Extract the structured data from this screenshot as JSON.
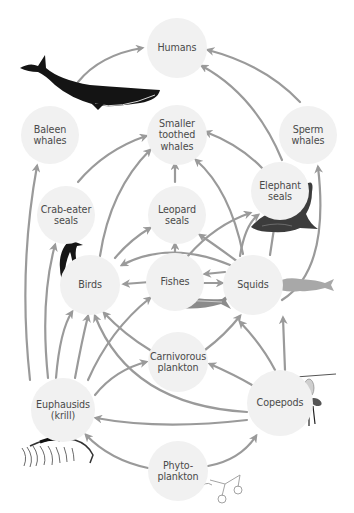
{
  "diagram": {
    "type": "food-web",
    "arrow_color": "#9a9a9a",
    "node_fill": "#f1f1f1",
    "label_color": "#4a4a4a",
    "nodes": [
      {
        "id": "humans",
        "label": "Humans",
        "x": 177,
        "y": 48,
        "r": 30
      },
      {
        "id": "baleen",
        "label": "Baleen\nwhales",
        "x": 50,
        "y": 135,
        "r": 29
      },
      {
        "id": "toothed",
        "label": "Smaller\ntoothed\nwhales",
        "x": 177,
        "y": 135,
        "r": 30
      },
      {
        "id": "sperm",
        "label": "Sperm\nwhales",
        "x": 308,
        "y": 135,
        "r": 29
      },
      {
        "id": "crabeater",
        "label": "Crab-eater\nseals",
        "x": 66,
        "y": 215,
        "r": 29
      },
      {
        "id": "leopard",
        "label": "Leopard\nseals",
        "x": 177,
        "y": 215,
        "r": 29
      },
      {
        "id": "elephant",
        "label": "Elephant\nseals",
        "x": 280,
        "y": 191,
        "r": 29
      },
      {
        "id": "birds",
        "label": "Birds",
        "x": 90,
        "y": 285,
        "r": 30
      },
      {
        "id": "fishes",
        "label": "Fishes",
        "x": 175,
        "y": 282,
        "r": 29
      },
      {
        "id": "squids",
        "label": "Squids",
        "x": 253,
        "y": 285,
        "r": 30
      },
      {
        "id": "carniv",
        "label": "Carnivorous\nplankton",
        "x": 178,
        "y": 362,
        "r": 30
      },
      {
        "id": "krill",
        "label": "Euphausids\n(krill)",
        "x": 63,
        "y": 410,
        "r": 32
      },
      {
        "id": "copepods",
        "label": "Copepods",
        "x": 280,
        "y": 403,
        "r": 33
      },
      {
        "id": "phyto",
        "label": "Phyto-\nplankton",
        "x": 178,
        "y": 471,
        "r": 30
      }
    ],
    "edges": [
      {
        "from": "baleen",
        "to": "humans",
        "d": "M78,82 Q100,55 142,48"
      },
      {
        "from": "sperm",
        "to": "humans",
        "d": "M300,102 Q265,65 208,50"
      },
      {
        "from": "elephant",
        "to": "humans",
        "d": "M282,160 Q255,95 202,66"
      },
      {
        "from": "crabeater",
        "to": "toothed",
        "d": "M78,182 Q105,150 146,136"
      },
      {
        "from": "leopard",
        "to": "toothed",
        "d": "M175,182 L175,164"
      },
      {
        "from": "elephant",
        "to": "toothed",
        "d": "M262,168 Q240,145 206,132"
      },
      {
        "from": "birds",
        "to": "toothed",
        "d": "M100,256 Q110,190 150,150"
      },
      {
        "from": "squids",
        "to": "toothed",
        "d": "M243,254 Q230,190 196,160"
      },
      {
        "from": "krill",
        "to": "baleen",
        "d": "M30,380 Q18,270 37,166"
      },
      {
        "from": "squids",
        "to": "sperm",
        "d": "M282,300 Q330,270 318,167"
      },
      {
        "from": "krill",
        "to": "crabeater",
        "d": "M48,378 Q40,300 55,245"
      },
      {
        "from": "birds",
        "to": "leopard",
        "d": "M115,258 Q130,240 150,228"
      },
      {
        "from": "fishes",
        "to": "leopard",
        "d": "M175,252 L175,244"
      },
      {
        "from": "squids",
        "to": "elephant",
        "d": "M240,256 Q245,225 258,215"
      },
      {
        "from": "fishes",
        "to": "elephant",
        "d": "M188,256 Q215,225 250,213"
      },
      {
        "from": "squids",
        "to": "leopard",
        "d": "M238,262 Q215,245 200,235"
      },
      {
        "from": "squids",
        "to": "birds",
        "d": "M230,265 Q170,240 122,265"
      },
      {
        "from": "fishes",
        "to": "birds",
        "d": "M150,282 L124,284"
      },
      {
        "from": "fishes",
        "to": "squids",
        "d": "M203,283 L222,283"
      },
      {
        "from": "squids",
        "to": "fishes",
        "d": "M225,272 L205,274"
      },
      {
        "from": "squids",
        "to": "elephant-up",
        "d": "M270,255 L275,222"
      },
      {
        "from": "krill",
        "to": "birds",
        "d": "M56,378 Q60,330 72,312"
      },
      {
        "from": "krill",
        "to": "birds-2",
        "d": "M75,378 Q82,340 88,316"
      },
      {
        "from": "krill",
        "to": "fishes",
        "d": "M88,380 Q110,330 150,298"
      },
      {
        "from": "krill",
        "to": "carniv",
        "d": "M95,395 Q115,370 146,362"
      },
      {
        "from": "carniv",
        "to": "birds",
        "d": "M150,350 Q125,335 104,313"
      },
      {
        "from": "carniv",
        "to": "squids",
        "d": "M205,350 Q225,335 240,316"
      },
      {
        "from": "copepods",
        "to": "carniv",
        "d": "M252,385 Q235,375 210,364"
      },
      {
        "from": "copepods",
        "to": "birds",
        "d": "M247,412 Q130,405 95,316"
      },
      {
        "from": "copepods",
        "to": "squids",
        "d": "M275,370 Q262,345 240,322"
      },
      {
        "from": "copepods",
        "to": "squids-2",
        "d": "M285,370 L283,318"
      },
      {
        "from": "copepods",
        "to": "krill",
        "d": "M247,420 Q160,430 96,418"
      },
      {
        "from": "phyto",
        "to": "krill",
        "d": "M148,468 Q110,460 86,435"
      },
      {
        "from": "phyto",
        "to": "copepods",
        "d": "M208,466 Q240,460 256,436"
      }
    ]
  },
  "illustrations": [
    {
      "name": "blue-whale",
      "near": "Baleen whales"
    },
    {
      "name": "elephant-seal",
      "near": "Elephant seals"
    },
    {
      "name": "penguin",
      "near": "Birds"
    },
    {
      "name": "fish",
      "near": "Fishes"
    },
    {
      "name": "squid",
      "near": "Squids"
    },
    {
      "name": "copepod",
      "near": "Copepods"
    },
    {
      "name": "krill",
      "near": "Euphausids (krill)"
    },
    {
      "name": "phytoplankton",
      "near": "Phyto-plankton"
    }
  ],
  "caption": {
    "text": ""
  }
}
